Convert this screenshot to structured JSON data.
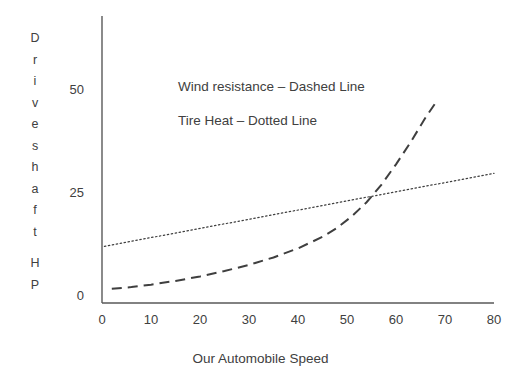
{
  "chart_data": {
    "type": "line",
    "title": "",
    "xlabel": "Our Automobile Speed",
    "ylabel": "Driveshaft HP",
    "xlim": [
      0,
      80
    ],
    "ylim": [
      0,
      60
    ],
    "xticks": [
      "0",
      "10",
      "20",
      "30",
      "40",
      "50",
      "60",
      "70",
      "80"
    ],
    "xtick_values": [
      0,
      10,
      20,
      30,
      40,
      50,
      60,
      70,
      80
    ],
    "yticks": [
      "0",
      "25",
      "50"
    ],
    "ytick_values": [
      0,
      25,
      50
    ],
    "grid": false,
    "legend_position": "inside-upper-left",
    "axis_color": "#595959",
    "line_color": "#3f3f3f",
    "background": "#ffffff",
    "series": [
      {
        "name": "Wind resistance",
        "style": "dashed",
        "legend_text": "Wind resistance – Dashed Line",
        "x": [
          2,
          6,
          10,
          15,
          20,
          25,
          30,
          35,
          40,
          45,
          48,
          51,
          54,
          57,
          60,
          63,
          66,
          68
        ],
        "values": [
          2.0,
          2.4,
          3.0,
          3.9,
          5.0,
          6.3,
          7.8,
          9.6,
          11.8,
          14.6,
          16.8,
          19.6,
          23.0,
          27.2,
          32.2,
          37.6,
          43.5,
          47.0
        ]
      },
      {
        "name": "Tire Heat",
        "style": "dotted",
        "legend_text": "Tire Heat – Dotted Line",
        "x": [
          0.5,
          80
        ],
        "values": [
          12.3,
          30.0
        ]
      }
    ],
    "annotations": [
      {
        "name": "crossover",
        "x": 58,
        "y": 27.5,
        "note": "dashed curve overtakes dotted line"
      }
    ]
  },
  "y_axis_caption_letters": [
    "D",
    "r",
    "i",
    "v",
    "e",
    "s",
    "h",
    "a",
    "f",
    "t",
    "",
    "H",
    "P"
  ],
  "legend": {
    "wind": "Wind resistance – Dashed Line",
    "tire": "Tire Heat – Dotted Line"
  },
  "axis": {
    "x_title": "Our Automobile Speed"
  }
}
